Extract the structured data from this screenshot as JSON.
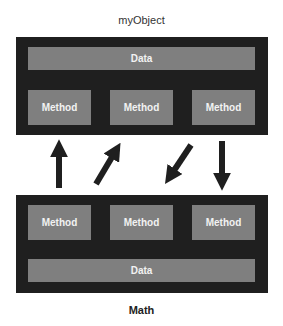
{
  "diagram": {
    "top_object": {
      "title": "myObject",
      "data_label": "Data",
      "methods": [
        "Method",
        "Method",
        "Method"
      ]
    },
    "bottom_object": {
      "title": "Math",
      "data_label": "Data",
      "methods": [
        "Method",
        "Method",
        "Method"
      ]
    },
    "arrows": [
      {
        "direction": "up",
        "icon": "arrow-up-icon"
      },
      {
        "direction": "up-right",
        "icon": "arrow-up-right-icon"
      },
      {
        "direction": "down-left",
        "icon": "arrow-down-left-icon"
      },
      {
        "direction": "down",
        "icon": "arrow-down-icon"
      }
    ],
    "colors": {
      "object_bg": "#1f1f1f",
      "box_bg": "#7f7f7f",
      "box_text": "#f2f2f2",
      "arrow": "#1f1f1f"
    }
  }
}
